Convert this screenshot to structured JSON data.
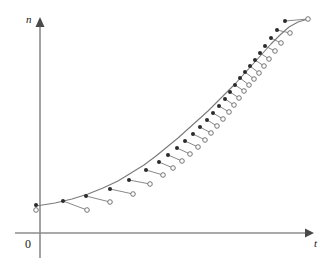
{
  "figure": {
    "background_color": "#ffffff",
    "axis_color": "#8c8c8c",
    "curve_color": "#7a7a7a",
    "marker_fill_color": "#2b2b2b",
    "marker_open_color": "#6e6e6e"
  },
  "axes": {
    "y_label": "n",
    "x_label": "t",
    "origin_label": "0",
    "y_axis_x": 40,
    "x_axis_y": 233,
    "y_axis_top": 20,
    "x_axis_right": 312,
    "x_axis_left": 15,
    "y_axis_bottom": 258
  },
  "chart_data": {
    "type": "line",
    "title": "",
    "subtitle": "",
    "xlabel": "t",
    "ylabel": "n",
    "grid": false,
    "legend": null,
    "axis_ticks": false,
    "xlim": [
      0,
      331
    ],
    "ylim": [
      233,
      14
    ],
    "series": [
      {
        "name": "filled-marker-series",
        "marker": "filled-circle",
        "x": [
          36,
          63,
          86,
          110,
          129,
          146,
          159,
          168,
          177,
          185,
          193,
          200,
          207,
          213,
          219,
          225,
          230,
          235,
          240,
          245,
          250,
          255,
          260,
          265,
          271,
          277,
          285
        ],
        "y": [
          205,
          201,
          196,
          189,
          180,
          170,
          162,
          155,
          148,
          141,
          134,
          127,
          120,
          113,
          106,
          99,
          92,
          85,
          78,
          72,
          66,
          60,
          53,
          46,
          38,
          30,
          21
        ]
      },
      {
        "name": "open-marker-series",
        "marker": "open-circle",
        "x": [
          36,
          87,
          110,
          133,
          150,
          163,
          173,
          182,
          190,
          198,
          205,
          211,
          217,
          223,
          229,
          234,
          239,
          244,
          249,
          254,
          259,
          264,
          269,
          275,
          281,
          290,
          308
        ],
        "y": [
          210,
          210,
          202,
          194,
          184,
          175,
          168,
          161,
          154,
          147,
          140,
          133,
          126,
          119,
          112,
          105,
          98,
          91,
          85,
          79,
          73,
          66,
          59,
          51,
          43,
          33,
          19
        ]
      }
    ],
    "curve": {
      "name": "fitted-growth-curve",
      "points_x": [
        36,
        55,
        72,
        88,
        103,
        118,
        131,
        144,
        156,
        167,
        178,
        188,
        198,
        208,
        217,
        226,
        235,
        244,
        253,
        262,
        271,
        280,
        289,
        298,
        308
      ],
      "points_y": [
        206,
        203,
        199,
        194,
        188,
        181,
        173,
        165,
        156,
        147,
        138,
        129,
        120,
        111,
        102,
        93,
        84,
        74,
        64,
        54,
        44,
        35,
        27,
        22,
        19
      ]
    }
  }
}
